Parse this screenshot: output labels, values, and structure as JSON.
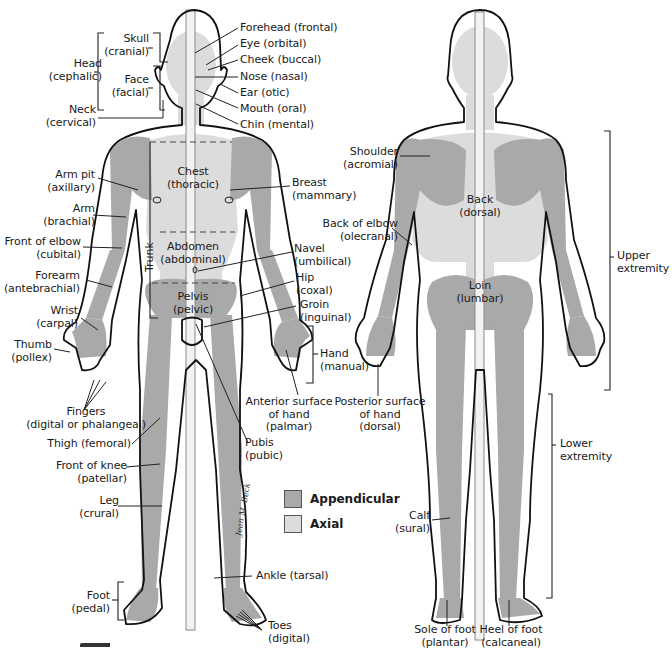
{
  "colors": {
    "appendicular": "#a9a9a9",
    "axial": "#dcdcdc",
    "outline": "#111111",
    "axis_line": "#8a8a8a"
  },
  "legend": {
    "items": [
      {
        "label": "Appendicular",
        "color": "#a9a9a9"
      },
      {
        "label": "Axial",
        "color": "#dcdcdc"
      }
    ]
  },
  "anterior": {
    "head": {
      "title": "Head",
      "sub": "(cephalic)"
    },
    "skull": {
      "title": "Skull",
      "sub": "(cranial)"
    },
    "face": {
      "title": "Face",
      "sub": "(facial)"
    },
    "neck": {
      "title": "Neck",
      "sub": "(cervical)"
    },
    "forehead": "Forehead (frontal)",
    "eye": "Eye (orbital)",
    "cheek": "Cheek (buccal)",
    "nose": "Nose (nasal)",
    "ear": "Ear (otic)",
    "mouth": "Mouth (oral)",
    "chin": "Chin (mental)",
    "armpit": {
      "title": "Arm pit",
      "sub": "(axillary)"
    },
    "arm": {
      "title": "Arm",
      "sub": "(brachial)"
    },
    "front_elbow": {
      "title": "Front of elbow",
      "sub": "(cubital)"
    },
    "forearm": {
      "title": "Forearm",
      "sub": "(antebrachial)"
    },
    "wrist": {
      "title": "Wrist",
      "sub": "(carpal)"
    },
    "thumb": {
      "title": "Thumb",
      "sub": "(pollex)"
    },
    "fingers": {
      "title": "Fingers",
      "sub": "(digital or phalangeal)"
    },
    "thigh": "Thigh (femoral)",
    "front_knee": {
      "title": "Front of knee",
      "sub": "(patellar)"
    },
    "leg": {
      "title": "Leg",
      "sub": "(crural)"
    },
    "foot": {
      "title": "Foot",
      "sub": "(pedal)"
    },
    "chest": {
      "title": "Chest",
      "sub": "(thoracic)"
    },
    "abdomen": {
      "title": "Abdomen",
      "sub": "(abdominal)"
    },
    "pelvis": {
      "title": "Pelvis",
      "sub": "(pelvic)"
    },
    "trunk": "Trunk",
    "breast": {
      "title": "Breast",
      "sub": "(mammary)"
    },
    "navel": {
      "title": "Navel",
      "sub": "(umbilical)"
    },
    "hip": {
      "title": "Hip",
      "sub": "(coxal)"
    },
    "groin": {
      "title": "Groin",
      "sub": "(inguinal)"
    },
    "hand": {
      "title": "Hand",
      "sub": "(manual)"
    },
    "anterior_hand": {
      "l1": "Anterior surface",
      "l2": "of hand",
      "l3": "(palmar)"
    },
    "pubis": {
      "title": "Pubis",
      "sub": "(pubic)"
    },
    "ankle": "Ankle (tarsal)",
    "toes": {
      "title": "Toes",
      "sub": "(digital)"
    },
    "signature": "Jean M. Beck"
  },
  "posterior": {
    "shoulder": {
      "title": "Shoulder",
      "sub": "(acromial)"
    },
    "back_elbow": {
      "title": "Back of elbow",
      "sub": "(olecranal)"
    },
    "back": {
      "title": "Back",
      "sub": "(dorsal)"
    },
    "loin": {
      "title": "Loin",
      "sub": "(lumbar)"
    },
    "posterior_hand": {
      "l1": "Posterior surface",
      "l2": "of hand",
      "l3": "(dorsal)"
    },
    "calf": {
      "title": "Calf",
      "sub": "(sural)"
    },
    "sole": {
      "title": "Sole of foot",
      "sub": "(plantar)"
    },
    "heel": {
      "title": "Heel of foot",
      "sub": "(calcaneal)"
    },
    "upper_extremity": {
      "title": "Upper",
      "sub": "extremity"
    },
    "lower_extremity": {
      "title": "Lower",
      "sub": "extremity"
    }
  }
}
